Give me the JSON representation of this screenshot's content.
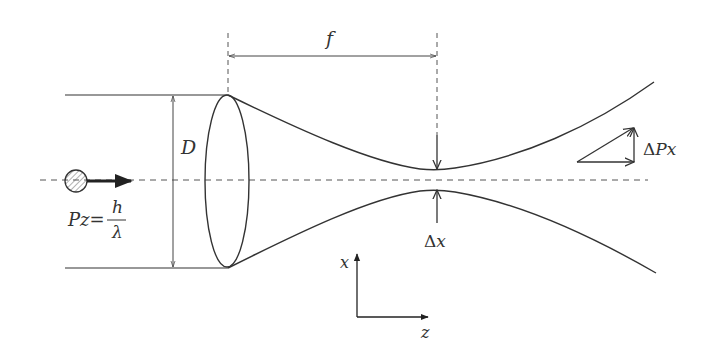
{
  "diagram": {
    "type": "physics-optics",
    "labels": {
      "focal_length": "f",
      "diameter": "D",
      "waist": "Δx",
      "momentum_transverse": "ΔPx",
      "momentum_z_lhs": "Pz=",
      "momentum_z_num": "h",
      "momentum_z_den": "λ",
      "axis_x": "x",
      "axis_z": "z"
    },
    "colors": {
      "stroke": "#333333",
      "dash": "#555555",
      "background": "#ffffff"
    }
  }
}
